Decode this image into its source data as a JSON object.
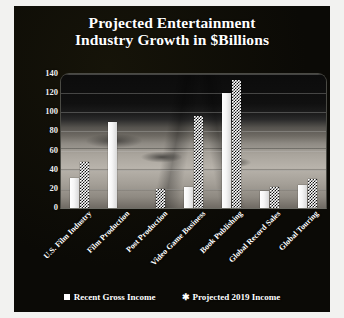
{
  "chart_data": {
    "type": "bar",
    "title": "Projected Entertainment Industry Growth in $Billions",
    "title_line1": "Projected Entertainment",
    "title_line2": "Industry Growth in $Billions",
    "xlabel": "",
    "ylabel": "",
    "ylim": [
      0,
      140
    ],
    "yticks": [
      0,
      20,
      40,
      60,
      80,
      100,
      120,
      140
    ],
    "grid": true,
    "legend_position": "bottom",
    "categories": [
      "U.S. Film Industry",
      "Film Production",
      "Post Production",
      "Video Game Business",
      "Book Publishing",
      "Global Record Sales",
      "Global Touring"
    ],
    "series": [
      {
        "name": "Recent Gross Income",
        "marker": "solid-square",
        "values": [
          31,
          90,
          0,
          22,
          120,
          18,
          24
        ]
      },
      {
        "name": "Projected 2019 Income",
        "marker": "asterisk",
        "values": [
          48,
          0,
          20,
          96,
          134,
          22,
          30
        ]
      }
    ]
  },
  "legend": {
    "items": [
      {
        "label": "Recent Gross Income",
        "swatch": "solid-square-icon"
      },
      {
        "label": "Projected 2019 Income",
        "swatch": "asterisk-icon"
      }
    ]
  },
  "colors": {
    "panel_background": "#0d0c08",
    "title_text": "#ffffff",
    "axis_text": "#efefef",
    "bar_solid": "#ffffff",
    "bar_pattern_fg": "#111111",
    "bar_pattern_bg": "#ffffff",
    "gridline": "#c8c8c3",
    "page_background": "#ffffff"
  }
}
